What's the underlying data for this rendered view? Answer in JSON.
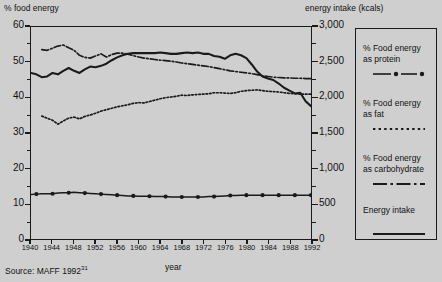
{
  "chart_data": {
    "type": "line",
    "title": "",
    "xlabel": "year",
    "ylabel": "% food energy",
    "ylabel_right": "energy intake (kcals)",
    "xlim": [
      1940,
      1992
    ],
    "ylim": [
      0,
      60
    ],
    "ylim_right": [
      0,
      3000
    ],
    "grid": false,
    "legend_position": "right-outside",
    "xticks": [
      "1940",
      "1944",
      "1948",
      "1952",
      "1956",
      "1960",
      "1964",
      "1968",
      "1972",
      "1976",
      "1980",
      "1984",
      "1988",
      "1992"
    ],
    "yticks_left": [
      "0",
      "10",
      "20",
      "30",
      "40",
      "50",
      "60"
    ],
    "yticks_right": [
      "0",
      "500",
      "1,000",
      "1,500",
      "2,000",
      "2,500",
      "3,000"
    ],
    "source": "Source: MAFF 1992",
    "source_superscript": "31",
    "series": [
      {
        "name": "% Food energy as protein",
        "style": "line-with-dots",
        "axis": "left",
        "x": [
          1940,
          1941,
          1942,
          1943,
          1944,
          1945,
          1946,
          1947,
          1948,
          1949,
          1950,
          1951,
          1952,
          1953,
          1954,
          1955,
          1956,
          1957,
          1958,
          1959,
          1960,
          1961,
          1962,
          1963,
          1964,
          1965,
          1966,
          1967,
          1968,
          1969,
          1970,
          1971,
          1972,
          1973,
          1974,
          1975,
          1976,
          1977,
          1978,
          1979,
          1980,
          1981,
          1982,
          1983,
          1984,
          1985,
          1986,
          1987,
          1988,
          1989,
          1990,
          1991,
          1992
        ],
        "values": [
          12.6,
          12.7,
          12.8,
          12.8,
          12.8,
          13.0,
          13.1,
          13.1,
          13.2,
          13.1,
          13.0,
          12.9,
          12.8,
          12.7,
          12.6,
          12.5,
          12.4,
          12.3,
          12.2,
          12.2,
          12.1,
          12.1,
          12.1,
          12.0,
          12.0,
          12.0,
          11.9,
          11.9,
          11.9,
          11.9,
          11.9,
          11.9,
          11.9,
          12.0,
          12.0,
          12.1,
          12.2,
          12.3,
          12.3,
          12.4,
          12.4,
          12.4,
          12.4,
          12.4,
          12.4,
          12.4,
          12.4,
          12.4,
          12.4,
          12.4,
          12.4,
          12.4,
          12.4
        ],
        "marker_years": [
          1941,
          1944,
          1947,
          1950,
          1953,
          1956,
          1959,
          1962,
          1965,
          1968,
          1971,
          1974,
          1977,
          1980,
          1983,
          1986,
          1989,
          1992
        ]
      },
      {
        "name": "% Food energy as fat",
        "style": "dotted",
        "axis": "left",
        "x": [
          1942,
          1943,
          1944,
          1945,
          1946,
          1947,
          1948,
          1949,
          1950,
          1951,
          1952,
          1953,
          1954,
          1955,
          1956,
          1957,
          1958,
          1959,
          1960,
          1961,
          1962,
          1963,
          1964,
          1965,
          1966,
          1967,
          1968,
          1969,
          1970,
          1971,
          1972,
          1973,
          1974,
          1975,
          1976,
          1977,
          1978,
          1979,
          1980,
          1981,
          1982,
          1983,
          1984,
          1985,
          1986,
          1987,
          1988,
          1989,
          1990,
          1991,
          1992
        ],
        "values": [
          34.8,
          34.2,
          33.6,
          32.5,
          33.4,
          34.2,
          34.5,
          34.0,
          34.7,
          35.1,
          35.6,
          36.2,
          36.6,
          37.0,
          37.4,
          37.7,
          38.0,
          38.4,
          38.6,
          38.5,
          38.9,
          39.3,
          39.7,
          40.0,
          40.2,
          40.4,
          40.7,
          40.6,
          40.8,
          40.9,
          41.0,
          41.1,
          41.4,
          41.4,
          41.3,
          41.2,
          41.4,
          41.8,
          42.0,
          42.1,
          42.2,
          42.0,
          41.8,
          41.7,
          41.6,
          41.4,
          41.2,
          41.1,
          41.0,
          41.0,
          41.0
        ]
      },
      {
        "name": "% Food energy as carbohydrate",
        "style": "dash-dot",
        "axis": "left",
        "x": [
          1942,
          1943,
          1944,
          1945,
          1946,
          1947,
          1948,
          1949,
          1950,
          1951,
          1952,
          1953,
          1954,
          1955,
          1956,
          1957,
          1958,
          1959,
          1960,
          1961,
          1962,
          1963,
          1964,
          1965,
          1966,
          1967,
          1968,
          1969,
          1970,
          1971,
          1972,
          1973,
          1974,
          1975,
          1976,
          1977,
          1978,
          1979,
          1980,
          1981,
          1982,
          1983,
          1984,
          1985,
          1986,
          1987,
          1988,
          1989,
          1990,
          1991,
          1992
        ],
        "values": [
          53.6,
          53.4,
          54.0,
          54.6,
          54.9,
          54.1,
          53.4,
          52.0,
          51.4,
          51.2,
          51.8,
          52.4,
          51.5,
          52.2,
          52.6,
          52.6,
          52.3,
          51.9,
          51.5,
          51.2,
          51.0,
          50.8,
          50.6,
          50.5,
          50.3,
          50.1,
          49.8,
          49.6,
          49.4,
          49.2,
          49.0,
          48.8,
          48.5,
          48.2,
          47.9,
          47.6,
          47.4,
          47.2,
          47.0,
          46.8,
          46.5,
          46.2,
          46.0,
          45.8,
          45.7,
          45.6,
          45.6,
          45.5,
          45.5,
          45.4,
          45.4
        ]
      },
      {
        "name": "Energy intake",
        "style": "solid",
        "axis": "right",
        "x": [
          1940,
          1941,
          1942,
          1943,
          1944,
          1945,
          1946,
          1947,
          1948,
          1949,
          1950,
          1951,
          1952,
          1953,
          1954,
          1955,
          1956,
          1957,
          1958,
          1959,
          1960,
          1961,
          1962,
          1963,
          1964,
          1965,
          1966,
          1967,
          1968,
          1969,
          1970,
          1971,
          1972,
          1973,
          1974,
          1975,
          1976,
          1977,
          1978,
          1979,
          1980,
          1981,
          1982,
          1983,
          1984,
          1985,
          1986,
          1987,
          1988,
          1989,
          1990,
          1991,
          1992
        ],
        "values": [
          2350,
          2330,
          2290,
          2300,
          2350,
          2330,
          2380,
          2420,
          2380,
          2350,
          2400,
          2440,
          2430,
          2450,
          2480,
          2530,
          2570,
          2600,
          2620,
          2630,
          2630,
          2630,
          2630,
          2630,
          2640,
          2630,
          2620,
          2620,
          2630,
          2640,
          2630,
          2640,
          2620,
          2620,
          2590,
          2580,
          2550,
          2600,
          2620,
          2600,
          2560,
          2470,
          2370,
          2300,
          2270,
          2250,
          2200,
          2140,
          2100,
          2060,
          2070,
          1950,
          1880
        ]
      }
    ]
  },
  "labels": {
    "axis_title_left": "% food energy",
    "axis_title_right": "energy intake (kcals)",
    "xaxis_title": "year",
    "source_prefix": "Source: MAFF 1992",
    "source_sup": "31"
  },
  "legend": {
    "items": [
      {
        "label_line1": "% Food energy",
        "label_line2": "as protein",
        "swatch": "line-dot-line-marker"
      },
      {
        "label_line1": "% Food energy",
        "label_line2": "as fat",
        "swatch": "dotted-marker"
      },
      {
        "label_line1": "% Food energy",
        "label_line2": "as carbohydrate",
        "swatch": "dash-dot-marker"
      },
      {
        "label_line1": "Energy intake",
        "label_line2": "",
        "swatch": "solid-marker"
      }
    ]
  },
  "colors": {
    "background": "#cfcfcf",
    "ink": "#1a1a1a",
    "plot_bg": "#cfcfcf"
  }
}
